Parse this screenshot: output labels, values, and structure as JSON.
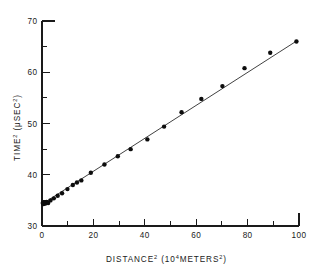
{
  "figure": {
    "background_color": "#ffffff",
    "ink_color": "#1a1a1a"
  },
  "chart_data": {
    "type": "scatter",
    "title": "",
    "subtitle": "",
    "xlabel": "DISTANCE² (10⁴METERS²)",
    "xlabel_base": "DISTANCE",
    "xlabel_sup": "2",
    "xlabel_units_open": "  (10",
    "xlabel_units_sup": "4",
    "xlabel_units_mid": "METERS",
    "xlabel_units_sup2": "2",
    "xlabel_units_close": ")",
    "ylabel": "TIME² (μSEC²)",
    "ylabel_base": "TIME",
    "ylabel_sup": "2",
    "ylabel_units_open": "  (μSEC",
    "ylabel_units_sup": "2",
    "ylabel_units_close": ")",
    "xlim": [
      0,
      100
    ],
    "ylim": [
      30,
      70
    ],
    "grid": false,
    "legend": null,
    "legend_position": "none",
    "xticks_major": [
      0,
      20,
      40,
      60,
      80,
      100
    ],
    "xticks_major_labels": [
      "0",
      "20",
      "40",
      "60",
      "80",
      "100"
    ],
    "xticks_minor": [
      10,
      30,
      50,
      70,
      90
    ],
    "yticks_major": [
      30,
      40,
      50,
      60,
      70
    ],
    "yticks_major_labels": [
      "30",
      "40",
      "50",
      "60",
      "70"
    ],
    "yticks_minor": [
      35,
      45,
      55,
      65
    ],
    "marker": "filled-circle",
    "marker_color": "#0d0d0d",
    "line_color": "#2b2b2b",
    "fit_line": {
      "intercept": 34.25,
      "slope": 0.3215,
      "x_start": 0,
      "x_end": 99.2
    },
    "points": [
      {
        "x": 0.3,
        "y": 34.5
      },
      {
        "x": 0.6,
        "y": 34.3
      },
      {
        "x": 0.9,
        "y": 34.6
      },
      {
        "x": 1.3,
        "y": 34.4
      },
      {
        "x": 1.8,
        "y": 34.7
      },
      {
        "x": 2.4,
        "y": 34.5
      },
      {
        "x": 3.3,
        "y": 35.0
      },
      {
        "x": 4.6,
        "y": 35.4
      },
      {
        "x": 6.1,
        "y": 35.9
      },
      {
        "x": 7.8,
        "y": 36.4
      },
      {
        "x": 9.9,
        "y": 37.2
      },
      {
        "x": 12.0,
        "y": 38.0
      },
      {
        "x": 13.6,
        "y": 38.5
      },
      {
        "x": 15.3,
        "y": 38.9
      },
      {
        "x": 19.0,
        "y": 40.4
      },
      {
        "x": 24.3,
        "y": 42.0
      },
      {
        "x": 29.5,
        "y": 43.6
      },
      {
        "x": 34.5,
        "y": 45.0
      },
      {
        "x": 41.0,
        "y": 46.9
      },
      {
        "x": 47.5,
        "y": 49.4
      },
      {
        "x": 54.3,
        "y": 52.2
      },
      {
        "x": 62.0,
        "y": 54.8
      },
      {
        "x": 70.2,
        "y": 57.3
      },
      {
        "x": 78.8,
        "y": 60.8
      },
      {
        "x": 88.8,
        "y": 63.8
      },
      {
        "x": 99.0,
        "y": 66.0
      }
    ]
  }
}
